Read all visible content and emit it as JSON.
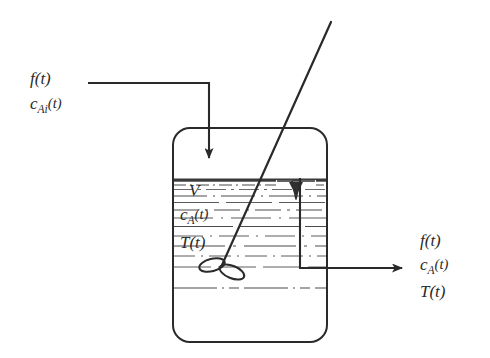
{
  "figure": {
    "kind": "process-flow-diagram",
    "background_color": "#ffffff",
    "ink_color": "#2a2a2a"
  },
  "inlet": {
    "flow_label": "f(t)",
    "concentration_label_base": "c",
    "concentration_label_sub": "Ai",
    "concentration_label_arg": "(t)"
  },
  "tank": {
    "volume_label": "V",
    "concentration_label_base": "c",
    "concentration_label_sub": "A",
    "concentration_label_arg": "(t)",
    "temperature_label": "T(t)"
  },
  "outlet": {
    "flow_label": "f(t)",
    "concentration_label_base": "c",
    "concentration_label_sub": "A",
    "concentration_label_arg": "(t)",
    "temperature_label": "T(t)"
  }
}
